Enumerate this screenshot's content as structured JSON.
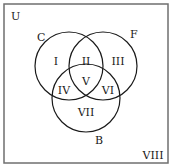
{
  "diagram": {
    "type": "venn-3-set",
    "universe_label": "U",
    "sets": [
      {
        "name": "C",
        "label": "C",
        "cx": 69,
        "cy": 66,
        "r": 34,
        "label_x": 37,
        "label_y": 41
      },
      {
        "name": "F",
        "label": "F",
        "cx": 103,
        "cy": 66,
        "r": 34,
        "label_x": 130,
        "label_y": 38
      },
      {
        "name": "B",
        "label": "B",
        "cx": 86,
        "cy": 98,
        "r": 34,
        "label_x": 95,
        "label_y": 144
      }
    ],
    "regions": [
      {
        "label": "I",
        "x": 56,
        "y": 65
      },
      {
        "label": "II",
        "x": 86,
        "y": 65
      },
      {
        "label": "III",
        "x": 118,
        "y": 65
      },
      {
        "label": "IV",
        "x": 64,
        "y": 94
      },
      {
        "label": "V",
        "x": 86,
        "y": 85
      },
      {
        "label": "VI",
        "x": 108,
        "y": 94
      },
      {
        "label": "VII",
        "x": 86,
        "y": 116
      },
      {
        "label": "VIII",
        "x": 153,
        "y": 159
      }
    ],
    "colors": {
      "stroke": "#1a1a1a",
      "background": "#ffffff",
      "frame": "#7a7a7a"
    }
  }
}
